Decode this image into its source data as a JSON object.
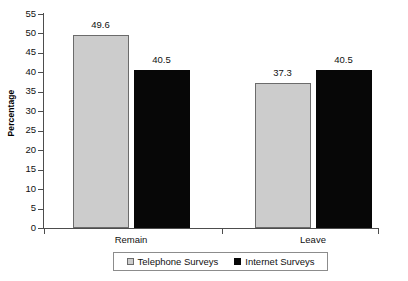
{
  "chart_data": {
    "type": "bar",
    "title": "",
    "subtitle": "",
    "xlabel": "",
    "ylabel": "Percentage",
    "categories": [
      "Remain",
      "Leave"
    ],
    "series": [
      {
        "name": "Telephone Surveys",
        "color": "#cccccc",
        "values": [
          49.6,
          37.3
        ]
      },
      {
        "name": "Internet Surveys",
        "color": "#070707",
        "values": [
          40.5,
          40.5
        ]
      }
    ],
    "ylim": [
      0,
      55
    ],
    "ytick_step": 5,
    "yticks": [
      0,
      5,
      10,
      15,
      20,
      25,
      30,
      35,
      40,
      45,
      50,
      55
    ],
    "ytick_labels": [
      "0",
      "5",
      "10",
      "15",
      "20",
      "25",
      "30",
      "35",
      "40",
      "45",
      "50",
      "55"
    ],
    "data_labels": [
      "49.6",
      "40.5",
      "37.3",
      "40.5"
    ],
    "grid": false,
    "legend_position": "bottom-center",
    "legend_entries": [
      "Telephone Surveys",
      "Internet Surveys"
    ],
    "axis_color": "#4d4d4d",
    "background": "#ffffff"
  }
}
